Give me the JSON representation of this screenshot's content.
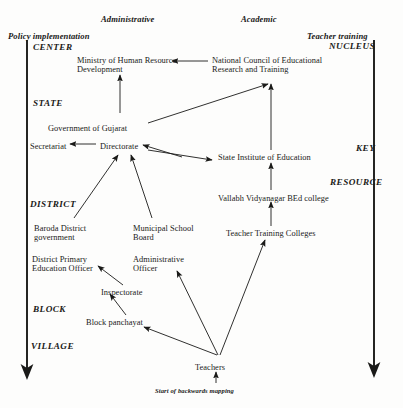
{
  "figure": {
    "background_color": "#fdfdfc",
    "ink_color": "#1a1a18",
    "width": 403,
    "height": 408
  },
  "column_headers": [
    {
      "id": "policy-implementation",
      "label": "Policy implementation",
      "x": 8,
      "y": 32
    },
    {
      "id": "administrative",
      "label": "Administrative",
      "x": 101,
      "y": 15
    },
    {
      "id": "academic",
      "label": "Academic",
      "x": 241,
      "y": 15
    },
    {
      "id": "teacher-training",
      "label": "Teacher training",
      "x": 307,
      "y": 32
    }
  ],
  "left_rank_labels": [
    {
      "id": "center",
      "label": "CENTER",
      "x": 33,
      "y": 42
    },
    {
      "id": "state",
      "label": "STATE",
      "x": 33,
      "y": 98
    },
    {
      "id": "district",
      "label": "DISTRICT",
      "x": 30,
      "y": 199
    },
    {
      "id": "block",
      "label": "BLOCK",
      "x": 33,
      "y": 304
    },
    {
      "id": "village",
      "label": "VILLAGE",
      "x": 31,
      "y": 341
    }
  ],
  "right_rank_labels": [
    {
      "id": "nucleus",
      "label": "NUCLEUS",
      "x": 329,
      "y": 41
    },
    {
      "id": "key",
      "label": "KEY",
      "x": 356,
      "y": 143
    },
    {
      "id": "resource",
      "label": "RESOURCE",
      "x": 330,
      "y": 177
    }
  ],
  "nodes": [
    {
      "id": "ministry-of-human-resource-development",
      "lines": [
        "Ministry of Human Resource",
        "Development"
      ],
      "x": 77,
      "y": 56,
      "align": "left"
    },
    {
      "id": "national-council-of-educational-research-and-training",
      "lines": [
        "National Council of Educational",
        "Research and Training"
      ],
      "x": 212,
      "y": 56,
      "align": "left"
    },
    {
      "id": "government-of-gujarat",
      "lines": [
        "Government of Gujarat"
      ],
      "x": 48,
      "y": 124,
      "align": "left"
    },
    {
      "id": "secretariat",
      "lines": [
        "Secretariat"
      ],
      "x": 30,
      "y": 142,
      "align": "left"
    },
    {
      "id": "directorate",
      "lines": [
        "Directorate"
      ],
      "x": 100,
      "y": 142,
      "align": "left"
    },
    {
      "id": "state-institute-of-education",
      "lines": [
        "State Institute of Education"
      ],
      "x": 218,
      "y": 153,
      "align": "left"
    },
    {
      "id": "vallabh-vidyanagar-bed-college",
      "lines": [
        "Vallabh Vidyanagar BEd college"
      ],
      "x": 218,
      "y": 194,
      "align": "left"
    },
    {
      "id": "teacher-training-colleges",
      "lines": [
        "Teacher Training Colleges"
      ],
      "x": 226,
      "y": 229,
      "align": "left"
    },
    {
      "id": "baroda-district-government",
      "lines": [
        "Baroda District",
        "government"
      ],
      "x": 34,
      "y": 224,
      "align": "left"
    },
    {
      "id": "municipal-school-board",
      "lines": [
        "Municipal School",
        "Board"
      ],
      "x": 133,
      "y": 224,
      "align": "left"
    },
    {
      "id": "district-primary-education-officer",
      "lines": [
        "District Primary",
        "Education Officer"
      ],
      "x": 32,
      "y": 255,
      "align": "left"
    },
    {
      "id": "administrative-officer",
      "lines": [
        "Administrative",
        "Officer"
      ],
      "x": 133,
      "y": 255,
      "align": "left"
    },
    {
      "id": "inspectorate",
      "lines": [
        "Inspectorate"
      ],
      "x": 101,
      "y": 288,
      "align": "left"
    },
    {
      "id": "block-panchayat",
      "lines": [
        "Block panchayat"
      ],
      "x": 86,
      "y": 318,
      "align": "left"
    },
    {
      "id": "teachers",
      "lines": [
        "Teachers"
      ],
      "x": 195,
      "y": 363,
      "align": "left"
    }
  ],
  "annotations": [
    {
      "id": "start-of-backwards-mapping",
      "label": "Start of backwards mapping",
      "x": 155,
      "y": 387
    }
  ],
  "spine_arrows": [
    {
      "id": "left-spine-arrow",
      "x1": 27,
      "y1": 40,
      "x2": 27,
      "y2": 380,
      "direction": "down"
    },
    {
      "id": "right-spine-arrow",
      "x1": 374,
      "y1": 40,
      "x2": 374,
      "y2": 378,
      "direction": "down"
    }
  ],
  "edges": [
    {
      "id": "ncert-to-mhrd",
      "from": "national-council-of-educational-research-and-training",
      "to": "ministry-of-human-resource-development",
      "x1": 208,
      "y1": 61,
      "x2": 172,
      "y2": 61,
      "heads": "end"
    },
    {
      "id": "gujarat-to-mhrd",
      "from": "government-of-gujarat",
      "to": "ministry-of-human-resource-development",
      "x1": 120,
      "y1": 113,
      "x2": 120,
      "y2": 75,
      "heads": "end"
    },
    {
      "id": "gujarat-to-ncert",
      "from": "government-of-gujarat",
      "to": "national-council-of-educational-research-and-training",
      "x1": 148,
      "y1": 123,
      "x2": 268,
      "y2": 84,
      "heads": "end"
    },
    {
      "id": "sie-to-ncert",
      "from": "state-institute-of-education",
      "to": "national-council-of-educational-research-and-training",
      "x1": 271,
      "y1": 150,
      "x2": 271,
      "y2": 84,
      "heads": "end"
    },
    {
      "id": "directorate-to-secretariat",
      "from": "directorate",
      "to": "secretariat",
      "x1": 96,
      "y1": 144,
      "x2": 70,
      "y2": 144,
      "heads": "end"
    },
    {
      "id": "sie-to-directorate",
      "from": "state-institute-of-education",
      "to": "directorate",
      "x1": 182,
      "y1": 157,
      "x2": 143,
      "y2": 145,
      "heads": "end"
    },
    {
      "id": "directorate-to-sie",
      "from": "directorate",
      "to": "state-institute-of-education",
      "x1": 148,
      "y1": 150,
      "x2": 212,
      "y2": 160,
      "heads": "end"
    },
    {
      "id": "vallabh-to-sie",
      "from": "vallabh-vidyanagar-bed-college",
      "to": "state-institute-of-education",
      "x1": 271,
      "y1": 190,
      "x2": 271,
      "y2": 163,
      "heads": "end"
    },
    {
      "id": "ttc-to-vallabh",
      "from": "teacher-training-colleges",
      "to": "vallabh-vidyanagar-bed-college",
      "x1": 271,
      "y1": 226,
      "x2": 271,
      "y2": 202,
      "heads": "end"
    },
    {
      "id": "baroda-to-directorate",
      "from": "baroda-district-government",
      "to": "directorate",
      "x1": 74,
      "y1": 218,
      "x2": 118,
      "y2": 155,
      "heads": "end"
    },
    {
      "id": "municipal-to-directorate",
      "from": "municipal-school-board",
      "to": "directorate",
      "x1": 152,
      "y1": 218,
      "x2": 131,
      "y2": 155,
      "heads": "end"
    },
    {
      "id": "inspectorate-to-dpeo",
      "from": "inspectorate",
      "to": "district-primary-education-officer",
      "x1": 123,
      "y1": 285,
      "x2": 98,
      "y2": 266,
      "heads": "end"
    },
    {
      "id": "block-panchayat-to-inspectorate",
      "from": "block-panchayat",
      "to": "inspectorate",
      "x1": 126,
      "y1": 315,
      "x2": 110,
      "y2": 294,
      "heads": "end"
    },
    {
      "id": "teachers-to-block-panchayat",
      "from": "teachers",
      "to": "block-panchayat",
      "x1": 217,
      "y1": 355,
      "x2": 144,
      "y2": 327,
      "heads": "end"
    },
    {
      "id": "teachers-to-administrative-officer",
      "from": "teachers",
      "to": "administrative-officer",
      "x1": 218,
      "y1": 355,
      "x2": 177,
      "y2": 271,
      "heads": "end"
    },
    {
      "id": "teachers-to-ttc",
      "from": "teachers",
      "to": "teacher-training-colleges",
      "x1": 220,
      "y1": 355,
      "x2": 265,
      "y2": 240,
      "heads": "end"
    },
    {
      "id": "backwards-mapping-into-teachers",
      "from": "start-of-backwards-mapping",
      "to": "teachers",
      "x1": 216,
      "y1": 383,
      "x2": 216,
      "y2": 372,
      "heads": "end"
    }
  ]
}
